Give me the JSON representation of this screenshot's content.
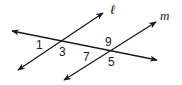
{
  "diagram": {
    "type": "parallel-lines-transversal",
    "lines": [
      {
        "name": "l",
        "label": "ℓ"
      },
      {
        "name": "m",
        "label": "m"
      },
      {
        "name": "transversal",
        "label": ""
      }
    ],
    "angles": [
      {
        "id": "1",
        "label": "1"
      },
      {
        "id": "3",
        "label": "3"
      },
      {
        "id": "9",
        "label": "9"
      },
      {
        "id": "7",
        "label": "7"
      },
      {
        "id": "5",
        "label": "5"
      }
    ],
    "colors": {
      "stroke": "#1a1a1a",
      "background": "#ffffff"
    }
  }
}
